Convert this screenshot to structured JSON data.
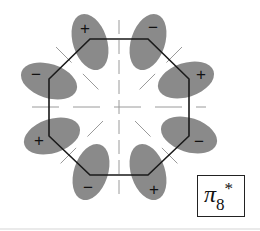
{
  "figure": {
    "label": {
      "symbol": "π",
      "subscript": "8",
      "superscript": "*"
    },
    "colors": {
      "lobe": "#8a8a8a",
      "ring": "#1a1a1a",
      "nodal_line": "#9a9a9a"
    },
    "lobes": [
      {
        "position": "top-left",
        "sign": "+"
      },
      {
        "position": "top-right",
        "sign": "−"
      },
      {
        "position": "right-top",
        "sign": "+"
      },
      {
        "position": "right-bottom",
        "sign": "−"
      },
      {
        "position": "bottom-right",
        "sign": "+"
      },
      {
        "position": "bottom-left",
        "sign": "−"
      },
      {
        "position": "left-bottom",
        "sign": "+"
      },
      {
        "position": "left-top",
        "sign": "−"
      }
    ]
  }
}
